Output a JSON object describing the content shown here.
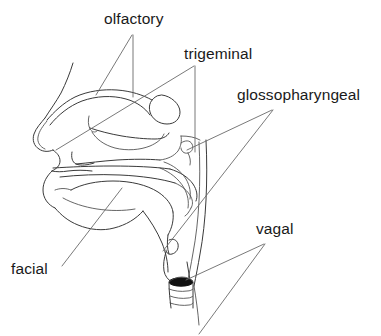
{
  "figure": {
    "background_color": "#ffffff",
    "stroke_color": "#3a3a3a",
    "leader_color": "#6a6a6a",
    "lumen_color": "#111111",
    "width": 381,
    "height": 336
  },
  "labels": {
    "olfactory": "olfactory",
    "trigeminal": "trigeminal",
    "glossopharyngeal": "glossopharyngeal",
    "vagal": "vagal",
    "facial": "facial"
  },
  "annotations": [
    {
      "name": "olfactory",
      "text": "olfactory",
      "text_x": 104,
      "text_y": 11,
      "leaders": 2,
      "targets": "olfactory epithelium at nasal roof / cribriform region"
    },
    {
      "name": "trigeminal",
      "text": "trigeminal",
      "text_x": 184,
      "text_y": 46,
      "leaders": 2,
      "targets": "nasal vestibule and turbinate mucosa"
    },
    {
      "name": "glossopharyngeal",
      "text": "glossopharyngeal",
      "text_x": 237,
      "text_y": 87,
      "leaders": 2,
      "targets": "nasopharynx and oropharynx wall"
    },
    {
      "name": "vagal",
      "text": "vagal",
      "text_x": 256,
      "text_y": 221,
      "leaders": 2,
      "targets": "larynx and trachea"
    },
    {
      "name": "facial",
      "text": "facial",
      "text_x": 11,
      "text_y": 261,
      "leaders": 1,
      "targets": "anterior tongue / palate"
    }
  ],
  "structures": [
    "nose profile",
    "nasal cavity",
    "superior turbinate",
    "middle turbinate",
    "inferior turbinate",
    "hard palate",
    "soft palate",
    "tongue",
    "lips",
    "mandible",
    "nasopharynx",
    "oropharynx",
    "epiglottis",
    "larynx",
    "trachea",
    "tracheal rings"
  ]
}
